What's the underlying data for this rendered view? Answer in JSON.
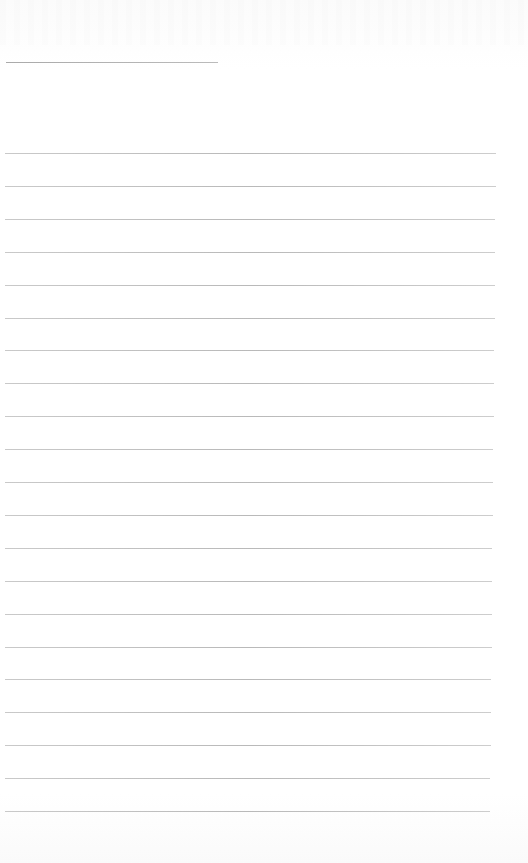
{
  "page": {
    "type": "lined-notebook-page",
    "background": "#ffffff",
    "rule_color": "#c0c0c0",
    "header_rule": {
      "top": 62,
      "left": 6,
      "right": 218
    },
    "rules": {
      "count": 21,
      "first_top": 153,
      "spacing": 32.9,
      "left": 5,
      "right_top": 496,
      "right_bottom": 490
    }
  }
}
